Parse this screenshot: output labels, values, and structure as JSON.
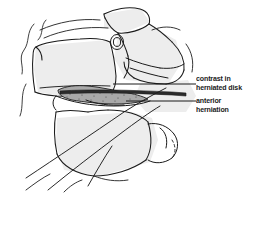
{
  "figure": {
    "kind": "medical-line-drawing",
    "background_color": "#ffffff",
    "ink_color": "#1b1b1b",
    "shade_color": "#ebebeb",
    "contrast_band_color": "#2b2b2b",
    "herniation_fill_color": "#a8a8a8"
  },
  "annotations": {
    "contrast": {
      "line1": "contrast in",
      "line2": "herniated disk",
      "leader_y": 84
    },
    "anterior": {
      "line1": "anterior",
      "line2": "herniation",
      "leader_y": 101
    }
  }
}
